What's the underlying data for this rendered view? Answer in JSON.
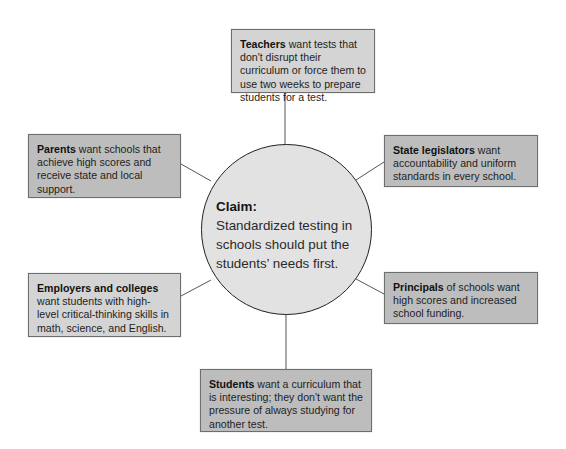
{
  "diagram": {
    "type": "stakeholder-claim-web",
    "center": {
      "title": "Claim:",
      "text": "Standardized testing in schools should put the students’ needs first."
    },
    "stakeholders": [
      {
        "id": "teachers",
        "position": "top",
        "group": "Teachers",
        "text": " want tests that don't disrupt their curriculum or force them to use two weeks to prepare students for a test."
      },
      {
        "id": "parents",
        "position": "upper-left",
        "group": "Parents",
        "text": " want schools that achieve high scores and receive state and local support."
      },
      {
        "id": "state-legislators",
        "position": "upper-right",
        "group": "State legislators",
        "text": " want accountability and uniform standards in every school."
      },
      {
        "id": "employers-colleges",
        "position": "lower-left",
        "group": "Employers and colleges",
        "text": " want students with high-level critical-thinking skills in math, science, and English."
      },
      {
        "id": "principals",
        "position": "lower-right",
        "group": "Principals",
        "text": " of schools want high scores and increased school funding."
      },
      {
        "id": "students",
        "position": "bottom",
        "group": "Students",
        "text": " want a curriculum that is interesting; they don't want the pressure of always studying for another test."
      }
    ],
    "colors": {
      "box_dark": "#bdbdbd",
      "box_light": "#d4d4d4",
      "circle_fill": "#e2e2e2",
      "stroke": "#555555"
    }
  }
}
